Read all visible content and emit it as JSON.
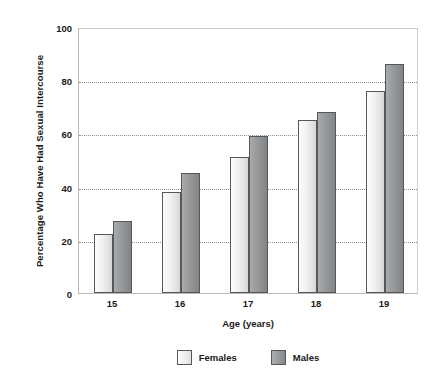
{
  "chart_data": {
    "type": "bar",
    "title": "",
    "xlabel": "Age (years)",
    "ylabel": "Percentage Who Have Had Sexual Intercourse",
    "categories": [
      "15",
      "16",
      "17",
      "18",
      "19"
    ],
    "series": [
      {
        "name": "Females",
        "values": [
          22,
          38,
          51,
          65,
          76
        ],
        "color": "#f0f0f0"
      },
      {
        "name": "Males",
        "values": [
          27,
          45,
          59,
          68,
          86
        ],
        "color": "#93969800"
      }
    ],
    "ylim": [
      0,
      100
    ],
    "yticks": [
      0,
      20,
      40,
      60,
      80,
      100
    ],
    "ytick_labels": [
      "0",
      "20",
      "40",
      "60",
      "80",
      "100"
    ],
    "grid": true,
    "grid_axis": "y",
    "legend_position": "bottom",
    "legend": [
      "Females",
      "Males"
    ]
  },
  "axes": {
    "y_title": "Percentage Who Have Had Sexual Intercourse",
    "x_title": "Age (years)"
  },
  "legend_items": [
    {
      "label": "Females"
    },
    {
      "label": "Males"
    }
  ],
  "colors": {
    "females_fill_light": "#fdfdfd",
    "females_fill_dark": "#d6d6d6",
    "males_fill_light": "#a9abac",
    "males_fill_dark": "#818486",
    "bar_border": "#55585a",
    "gridline": "#8d8d8d",
    "plot_border": "#b9b9b9",
    "text": "#1a1a1a",
    "background": "#ffffff"
  }
}
